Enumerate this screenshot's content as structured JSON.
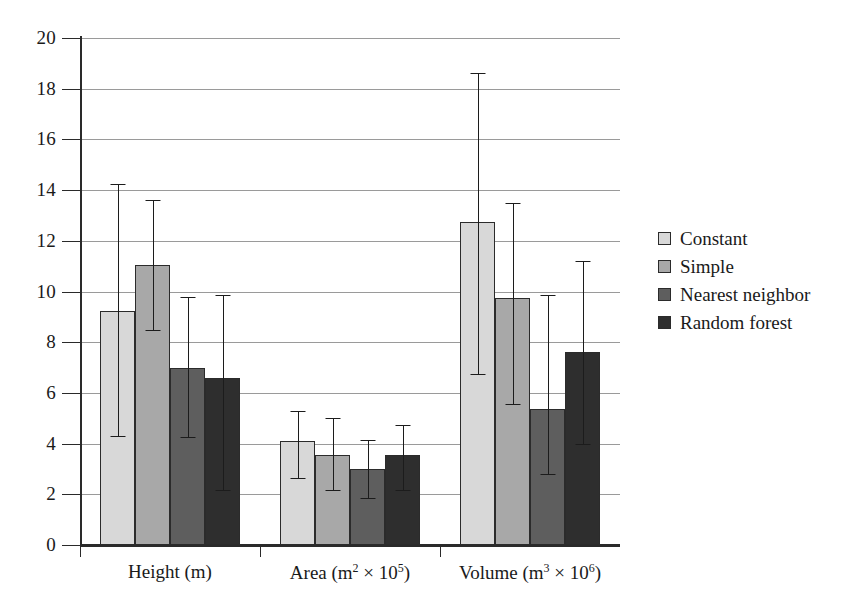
{
  "chart_data": {
    "type": "bar",
    "title": "",
    "xlabel": "",
    "ylabel": "",
    "ylim": [
      0,
      20
    ],
    "ytick_step": 2,
    "yticks": [
      0,
      2,
      4,
      6,
      8,
      10,
      12,
      14,
      16,
      18,
      20
    ],
    "ytick_labels": [
      "0",
      "2",
      "4",
      "6",
      "8",
      "10",
      "12",
      "14",
      "16",
      "18",
      "20"
    ],
    "grid": true,
    "grid_axis": "y",
    "legend_position": "right",
    "error_bars": true,
    "categories": [
      "Height (m)",
      "Area (m² × 10⁵)",
      "Volume (m³ × 10⁶)"
    ],
    "category_labels_html": [
      {
        "text": "Height (m)",
        "sup": ""
      },
      {
        "base": "Area (m",
        "sup1": "2",
        "mid": " × 10",
        "sup2": "5",
        "tail": ")"
      },
      {
        "base": "Volume (m",
        "sup1": "3",
        "mid": " × 10",
        "sup2": "6",
        "tail": ")"
      }
    ],
    "series": [
      {
        "name": "Constant",
        "color": "#d8d8d8",
        "values": [
          9.25,
          4.1,
          12.75
        ],
        "err_upper": [
          14.25,
          5.3,
          18.6
        ],
        "err_lower": [
          4.3,
          2.65,
          6.75
        ]
      },
      {
        "name": "Simple",
        "color": "#a8a8a8",
        "values": [
          11.05,
          3.55,
          9.75
        ],
        "err_upper": [
          13.6,
          5.0,
          13.5
        ],
        "err_lower": [
          8.5,
          2.15,
          5.55
        ]
      },
      {
        "name": "Nearest neighbor",
        "color": "#5e5e5e",
        "values": [
          7.0,
          3.0,
          5.35
        ],
        "err_upper": [
          9.8,
          4.15,
          9.85
        ],
        "err_lower": [
          4.25,
          1.85,
          2.8
        ]
      },
      {
        "name": "Random forest",
        "color": "#2e2e2e",
        "values": [
          6.6,
          3.55,
          7.6
        ],
        "err_upper": [
          9.85,
          4.75,
          11.2
        ],
        "err_lower": [
          2.15,
          2.15,
          4.0
        ]
      }
    ]
  },
  "legend": {
    "items": [
      {
        "label": "Constant",
        "color": "#d8d8d8"
      },
      {
        "label": "Simple",
        "color": "#a8a8a8"
      },
      {
        "label": "Nearest neighbor",
        "color": "#5e5e5e"
      },
      {
        "label": "Random forest",
        "color": "#2e2e2e"
      }
    ]
  }
}
